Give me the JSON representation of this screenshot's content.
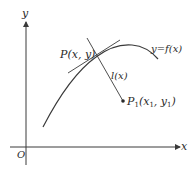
{
  "figure": {
    "type": "geometry-diagram"
  },
  "axes": {
    "x_label": "x",
    "y_label": "y",
    "origin_label": "O"
  },
  "labels": {
    "point_p": "P(x, y)",
    "curve": "y=f(x)",
    "distance": "l(x)",
    "point_p1_main": "P",
    "point_p1_sub": "1",
    "point_p1_coords": "(x",
    "point_p1_x_sub": "1",
    "point_p1_sep": ", y",
    "point_p1_y_sub": "1",
    "point_p1_close": ")"
  },
  "colors": {
    "stroke": "#3a3a3a",
    "text": "#2a2a2a",
    "background": "#ffffff"
  }
}
